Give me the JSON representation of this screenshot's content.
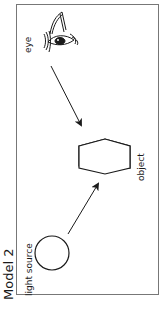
{
  "title": "Model 2",
  "labels": {
    "eye": "eye",
    "object": "object",
    "light_source": "light source"
  },
  "colors": {
    "stroke": "#1a1a1a",
    "frame": "#777777",
    "background": "#ffffff"
  },
  "arrows": [
    {
      "from": "light source",
      "to": "object"
    },
    {
      "from": "eye",
      "to": "object"
    }
  ]
}
